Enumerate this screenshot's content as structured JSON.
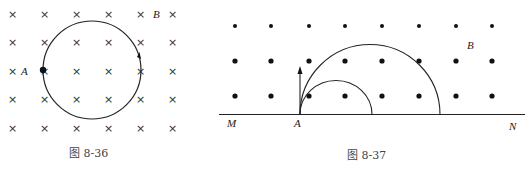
{
  "figure_left": {
    "caption": "图 8-36",
    "labels": {
      "point": "A",
      "field": "B"
    },
    "field_symbol": "×",
    "field_direction": "into-page",
    "grid": {
      "cols": 6,
      "rows": 5
    },
    "orbit": "circle",
    "orbit_direction_arrow": "clockwise"
  },
  "figure_right": {
    "caption": "图 8-37",
    "labels": {
      "point": "A",
      "field": "B",
      "left_end": "M",
      "right_end": "N"
    },
    "field_symbol": "•",
    "field_direction": "out-of-page",
    "grid": {
      "cols": 8,
      "rows": 3
    },
    "paths": [
      "small semicircle",
      "large semicircle"
    ],
    "velocity_arrow": "up"
  }
}
